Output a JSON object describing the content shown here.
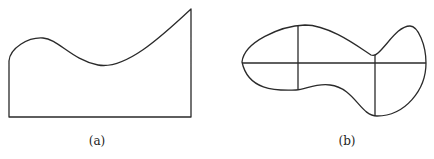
{
  "figure": {
    "panels": [
      {
        "id": "a",
        "caption": "(a)",
        "description": "Region bounded below by a straight line, on the left and right by vertical lines, and on top by a wavy curve rising to the upper-right corner"
      },
      {
        "id": "b",
        "caption": "(b)",
        "description": "Irregular closed blob-shaped region subdivided by one horizontal line and two vertical lines"
      }
    ],
    "stroke_color": "#2a2a2a",
    "background_color": "#ffffff"
  }
}
